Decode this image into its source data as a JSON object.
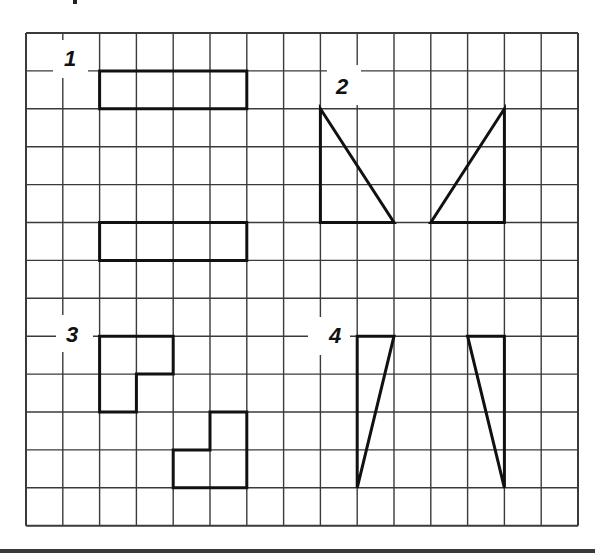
{
  "figure": {
    "grid": {
      "columns": 15,
      "rows": 13,
      "origin_x": 26,
      "origin_y": 33,
      "cell_w": 36.8,
      "cell_h": 37.9,
      "line_color": "#3a3a3a",
      "shape_color": "#111111"
    },
    "sections": [
      {
        "label": "1",
        "label_box": {
          "x": 53,
          "y": 40,
          "w": 35,
          "h": 38
        },
        "label_pos": {
          "x": 70,
          "y": 59
        },
        "shapes": [
          {
            "type": "polygon",
            "points": [
              [
                2,
                1
              ],
              [
                6,
                1
              ],
              [
                6,
                2
              ],
              [
                2,
                2
              ]
            ]
          },
          {
            "type": "polygon",
            "points": [
              [
                2,
                5
              ],
              [
                6,
                5
              ],
              [
                6,
                6
              ],
              [
                2,
                6
              ]
            ]
          }
        ]
      },
      {
        "label": "2",
        "label_box": {
          "x": 327,
          "y": 65,
          "w": 34,
          "h": 40
        },
        "label_pos": {
          "x": 342,
          "y": 87
        },
        "shapes": [
          {
            "type": "polygon",
            "points": [
              [
                8,
                2
              ],
              [
                8,
                5
              ],
              [
                10,
                5
              ]
            ]
          },
          {
            "type": "polygon",
            "points": [
              [
                13,
                2
              ],
              [
                13,
                5
              ],
              [
                11,
                5
              ]
            ]
          }
        ]
      },
      {
        "label": "3",
        "label_box": {
          "x": 56,
          "y": 315,
          "w": 37,
          "h": 37
        },
        "label_pos": {
          "x": 72,
          "y": 335
        },
        "shapes": [
          {
            "type": "polygon",
            "points": [
              [
                2,
                8
              ],
              [
                4,
                8
              ],
              [
                4,
                9
              ],
              [
                3,
                9
              ],
              [
                3,
                10
              ],
              [
                2,
                10
              ]
            ]
          },
          {
            "type": "polygon",
            "points": [
              [
                5,
                10
              ],
              [
                6,
                10
              ],
              [
                6,
                12
              ],
              [
                4,
                12
              ],
              [
                4,
                11
              ],
              [
                5,
                11
              ]
            ]
          }
        ]
      },
      {
        "label": "4",
        "label_box": {
          "x": 308,
          "y": 317,
          "w": 42,
          "h": 38
        },
        "label_pos": {
          "x": 335,
          "y": 336
        },
        "shapes": [
          {
            "type": "polygon",
            "points": [
              [
                9,
                8
              ],
              [
                10,
                8
              ],
              [
                9,
                12
              ]
            ]
          },
          {
            "type": "polygon",
            "points": [
              [
                12,
                8
              ],
              [
                13,
                8
              ],
              [
                13,
                12
              ]
            ]
          }
        ]
      }
    ]
  }
}
